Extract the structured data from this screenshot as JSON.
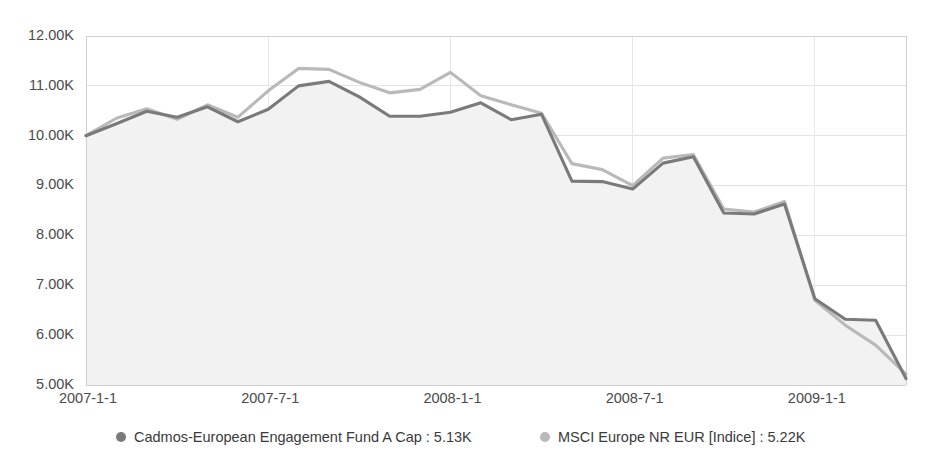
{
  "chart_data": {
    "type": "line",
    "title": "",
    "subtitle": "",
    "xlabel": "",
    "ylabel": "",
    "grid": true,
    "legend_position": "bottom",
    "ylim": [
      5000,
      12000
    ],
    "ytick_values": [
      5000,
      6000,
      7000,
      8000,
      9000,
      10000,
      11000,
      12000
    ],
    "ytick_labels": [
      "5.00K",
      "6.00K",
      "7.00K",
      "8.00K",
      "9.00K",
      "10.00K",
      "11.00K",
      "12.00K"
    ],
    "xtick_labels": [
      "2007-1-1",
      "2007-7-1",
      "2008-1-1",
      "2008-7-1",
      "2009-1-1"
    ],
    "xtick_x": [
      "2007-01-01",
      "2007-07-01",
      "2008-01-01",
      "2008-07-01",
      "2009-01-01"
    ],
    "x": [
      "2007-01-01",
      "2007-02-01",
      "2007-03-01",
      "2007-04-01",
      "2007-05-01",
      "2007-06-01",
      "2007-07-01",
      "2007-08-01",
      "2007-09-01",
      "2007-10-01",
      "2007-11-01",
      "2007-12-01",
      "2008-01-01",
      "2008-02-01",
      "2008-03-01",
      "2008-04-01",
      "2008-05-01",
      "2008-06-01",
      "2008-07-01",
      "2008-08-01",
      "2008-09-01",
      "2008-10-01",
      "2008-11-01",
      "2008-12-01",
      "2009-01-01",
      "2009-02-01",
      "2009-03-01",
      "2009-04-01"
    ],
    "series": [
      {
        "name": "Cadmos-European Engagement Fund A Cap",
        "color": "#7a7a7a",
        "fill_color": "#f2f2f2",
        "last_value_label": "5.13K",
        "values": [
          10000,
          10240,
          10490,
          10370,
          10580,
          10280,
          10530,
          11000,
          11090,
          10780,
          10390,
          10390,
          10470,
          10660,
          10320,
          10430,
          9090,
          9080,
          8930,
          9450,
          9580,
          8450,
          8430,
          8630,
          6730,
          6320,
          6300,
          5130
        ]
      },
      {
        "name": "MSCI Europe NR EUR [Indice]",
        "color": "#b9b9b9",
        "last_value_label": "5.22K",
        "values": [
          10000,
          10350,
          10540,
          10330,
          10620,
          10370,
          10900,
          11350,
          11330,
          11070,
          10860,
          10930,
          11270,
          10800,
          10620,
          10450,
          9440,
          9320,
          9000,
          9550,
          9620,
          8530,
          8470,
          8680,
          6700,
          6200,
          5800,
          5220
        ]
      }
    ],
    "legend": [
      {
        "marker": "circle-marker",
        "color": "#7a7a7a",
        "label": "Cadmos-European Engagement Fund A Cap : 5.13K"
      },
      {
        "marker": "circle-marker",
        "color": "#b9b9b9",
        "label": "MSCI Europe NR EUR [Indice] : 5.22K"
      }
    ]
  },
  "layout": {
    "plot_left": 86,
    "plot_right": 906,
    "plot_top": 36,
    "plot_bottom": 385,
    "legend_y": 437,
    "legend_items_x": [
      121,
      545
    ],
    "legend_text_offset": 13
  },
  "colors": {
    "background": "#ffffff",
    "grid": "#e3e3e3",
    "axis": "#cfcfcf",
    "text": "#3a3a3a",
    "series_primary": "#7a7a7a",
    "series_secondary": "#b9b9b9",
    "area_fill": "#f2f2f2"
  }
}
